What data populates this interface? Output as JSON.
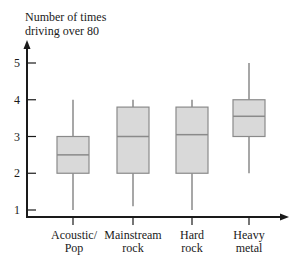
{
  "chart_data": {
    "type": "boxplot",
    "title": "",
    "ylabel": [
      "Number of times",
      "driving over 80"
    ],
    "xlabel": "",
    "ylim": [
      0.8,
      5.6
    ],
    "yticks": [
      1,
      2,
      3,
      4,
      5
    ],
    "grid": false,
    "legend": null,
    "categories": [
      {
        "label_line1": "Acoustic/",
        "label_line2": "Pop",
        "min": 1.0,
        "q1": 2.0,
        "median": 2.5,
        "q3": 3.0,
        "max": 4.0
      },
      {
        "label_line1": "Mainstream",
        "label_line2": "rock",
        "min": 1.1,
        "q1": 2.0,
        "median": 3.0,
        "q3": 3.8,
        "max": 4.0
      },
      {
        "label_line1": "Hard",
        "label_line2": "rock",
        "min": 1.0,
        "q1": 2.0,
        "median": 3.05,
        "q3": 3.8,
        "max": 4.0
      },
      {
        "label_line1": "Heavy",
        "label_line2": "metal",
        "min": 2.0,
        "q1": 3.0,
        "median": 3.55,
        "q3": 4.0,
        "max": 5.0
      }
    ],
    "colors": {
      "box_fill": "#d9d9d9",
      "box_stroke": "#8a8a8a",
      "axis": "#1a1a1a"
    }
  }
}
